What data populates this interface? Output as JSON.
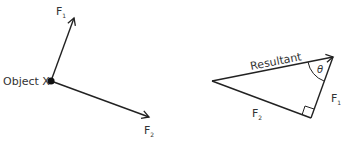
{
  "left_diagram": {
    "object_label": "Object X",
    "force1": {
      "label": "F",
      "subscript": "1"
    },
    "force2": {
      "label": "F",
      "subscript": "2"
    }
  },
  "right_diagram": {
    "resultant_label": "Resultant",
    "angle_label": "θ",
    "side1": {
      "label": "F",
      "subscript": "1"
    },
    "side2": {
      "label": "F",
      "subscript": "2"
    },
    "right_angle_marker": true
  },
  "colors": {
    "line": "#222222",
    "text": "#333333",
    "background": "#ffffff"
  }
}
